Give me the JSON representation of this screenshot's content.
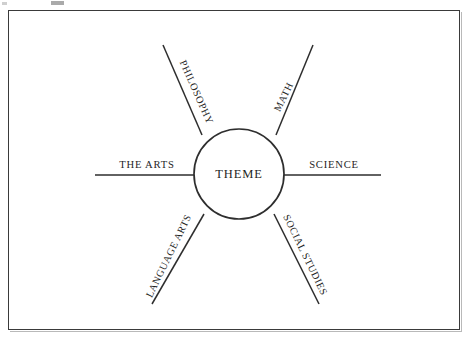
{
  "document": {
    "kind": "concept-web-diagram",
    "title": "Theme Web",
    "background_color": "#ffffff",
    "frame_color": "#3a3a3a",
    "ink_color": "#1f1f1f",
    "line_color": "#2e2e2e"
  },
  "hub": {
    "label": "THEME",
    "center_x": 239,
    "center_y": 174,
    "radius": 45
  },
  "spokes": [
    {
      "id": "philosophy",
      "label": "PHILOSOPHY",
      "direction": "upper-left",
      "angle_deg": -114,
      "text_rotation_deg": 66,
      "outer_x": 163,
      "outer_y": 45
    },
    {
      "id": "math",
      "label": "MATH",
      "direction": "upper-right",
      "angle_deg": -66,
      "text_rotation_deg": -64,
      "outer_x": 313,
      "outer_y": 45
    },
    {
      "id": "the-arts",
      "label": "THE ARTS",
      "direction": "left",
      "angle_deg": 180,
      "text_rotation_deg": 0,
      "outer_x": 95,
      "outer_y": 175
    },
    {
      "id": "science",
      "label": "SCIENCE",
      "direction": "right",
      "angle_deg": 0,
      "text_rotation_deg": 0,
      "outer_x": 381,
      "outer_y": 175
    },
    {
      "id": "language-arts",
      "label": "LANGUAGE ARTS",
      "direction": "lower-left",
      "angle_deg": 115,
      "text_rotation_deg": -64,
      "outer_x": 152,
      "outer_y": 304
    },
    {
      "id": "social-studies",
      "label": "SOCIAL STUDIES",
      "direction": "lower-right",
      "angle_deg": 64,
      "text_rotation_deg": 64,
      "outer_x": 319,
      "outer_y": 304
    }
  ]
}
